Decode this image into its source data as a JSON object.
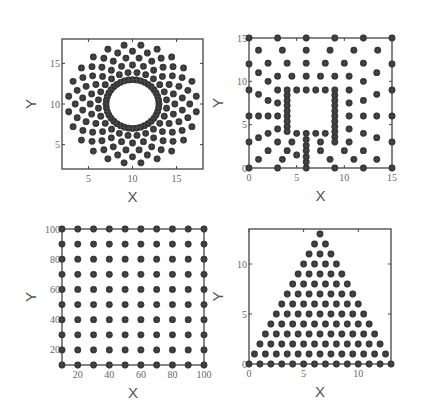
{
  "figure": {
    "background": "#ffffff",
    "marker_color": "#333333",
    "axis_color": "#444444"
  },
  "chart_data": [
    {
      "type": "scatter",
      "id": "ring",
      "title": "",
      "xlabel": "X",
      "ylabel": "Y",
      "xlim": [
        2,
        18
      ],
      "ylim": [
        2,
        18
      ],
      "xticks": [
        5,
        10,
        15
      ],
      "yticks": [
        5,
        10,
        15
      ],
      "grid": false,
      "description": "Annular point set: dense inner ring radius ~3 centered at (10,10), plus staggered concentric rings out to radius ~7.3",
      "generator": {
        "kind": "rings",
        "center": [
          10,
          10
        ],
        "radii": [
          3.0,
          3.9,
          4.8,
          5.7,
          6.5,
          7.3
        ],
        "counts": [
          40,
          24,
          24,
          24,
          24,
          24
        ]
      },
      "frame": {
        "left": 62,
        "top": 39,
        "width": 141,
        "height": 130
      }
    },
    {
      "type": "scatter",
      "id": "square-with-hole",
      "title": "",
      "xlabel": "X",
      "ylabel": "Y",
      "xlim": [
        0,
        15
      ],
      "ylim": [
        0,
        15
      ],
      "xticks": [
        0,
        5,
        10,
        15
      ],
      "yticks": [
        0,
        5,
        10,
        15
      ],
      "grid": false,
      "description": "Square domain [0,15]x[0,15] with inner square hole [4,9]x[4,9]; dense points on hole boundary, sparser points outward",
      "points": [
        [
          0,
          0
        ],
        [
          3,
          0
        ],
        [
          6,
          0
        ],
        [
          9,
          0
        ],
        [
          12,
          0
        ],
        [
          15,
          0
        ],
        [
          0,
          15
        ],
        [
          3,
          15
        ],
        [
          6,
          15
        ],
        [
          9,
          15
        ],
        [
          12,
          15
        ],
        [
          15,
          15
        ],
        [
          0,
          3
        ],
        [
          0,
          6
        ],
        [
          0,
          9
        ],
        [
          0,
          12
        ],
        [
          15,
          3
        ],
        [
          15,
          6
        ],
        [
          15,
          9
        ],
        [
          15,
          12
        ],
        [
          1,
          13.6
        ],
        [
          3.5,
          13.6
        ],
        [
          6,
          13.6
        ],
        [
          8.5,
          13.6
        ],
        [
          11,
          13.6
        ],
        [
          13.5,
          13.6
        ],
        [
          2,
          12.1
        ],
        [
          4,
          12.1
        ],
        [
          6,
          12.1
        ],
        [
          8,
          12.1
        ],
        [
          10,
          12.1
        ],
        [
          12,
          12.1
        ],
        [
          1,
          11
        ],
        [
          13.4,
          11
        ],
        [
          2,
          10
        ],
        [
          12,
          10
        ],
        [
          3,
          10.6
        ],
        [
          4.5,
          10.6
        ],
        [
          6,
          10.6
        ],
        [
          7.5,
          10.6
        ],
        [
          9,
          10.6
        ],
        [
          10.5,
          10.6
        ],
        [
          1,
          8.5
        ],
        [
          13.4,
          8.5
        ],
        [
          2,
          7.8
        ],
        [
          12,
          7.8
        ],
        [
          3,
          9
        ],
        [
          3,
          7.5
        ],
        [
          3,
          6
        ],
        [
          3,
          4.5
        ],
        [
          3,
          3
        ],
        [
          1,
          6
        ],
        [
          2,
          6
        ],
        [
          10.5,
          6
        ],
        [
          12,
          6
        ],
        [
          13.4,
          6
        ],
        [
          1,
          3.5
        ],
        [
          13.4,
          3.5
        ],
        [
          2,
          4
        ],
        [
          12,
          4
        ],
        [
          2,
          2
        ],
        [
          12,
          2
        ],
        [
          1,
          1
        ],
        [
          13.4,
          1
        ],
        [
          11,
          1
        ],
        [
          3.5,
          1
        ],
        [
          4,
          2
        ],
        [
          8.5,
          1
        ],
        [
          7.5,
          2
        ],
        [
          5,
          1.5
        ],
        [
          10.5,
          9
        ],
        [
          10.5,
          7.5
        ],
        [
          10.5,
          4.5
        ],
        [
          10.5,
          3
        ],
        [
          10,
          2
        ],
        [
          4,
          9
        ],
        [
          4,
          8.4
        ],
        [
          4,
          7.8
        ],
        [
          4,
          7.2
        ],
        [
          4,
          6.6
        ],
        [
          4,
          6
        ],
        [
          4,
          5.4
        ],
        [
          4,
          4.8
        ],
        [
          4,
          4.2
        ],
        [
          9,
          9
        ],
        [
          9,
          8.4
        ],
        [
          9,
          7.8
        ],
        [
          9,
          7.2
        ],
        [
          9,
          6.6
        ],
        [
          9,
          6
        ],
        [
          9,
          5.4
        ],
        [
          9,
          4.8
        ],
        [
          9,
          4.2
        ],
        [
          9,
          3.6
        ],
        [
          9,
          3
        ],
        [
          5,
          9
        ],
        [
          6,
          9
        ],
        [
          7,
          9
        ],
        [
          8,
          9
        ],
        [
          5,
          4
        ],
        [
          7,
          4
        ],
        [
          8,
          4
        ],
        [
          6,
          4
        ],
        [
          6,
          3.3
        ],
        [
          6,
          2.6
        ],
        [
          6,
          2
        ],
        [
          6,
          1.3
        ],
        [
          6,
          0.7
        ],
        [
          4.5,
          3
        ],
        [
          7.5,
          3
        ]
      ],
      "frame": {
        "left": 249,
        "top": 38,
        "width": 143,
        "height": 130
      }
    },
    {
      "type": "scatter",
      "id": "uniform-grid",
      "title": "",
      "xlabel": "X",
      "ylabel": "Y",
      "xlim": [
        10,
        100
      ],
      "ylim": [
        10,
        100
      ],
      "xticks": [
        20,
        40,
        60,
        80,
        100
      ],
      "yticks": [
        20,
        40,
        60,
        80,
        100
      ],
      "grid": false,
      "description": "Regular 10x10 grid of points at x,y in {10,20,...,100}",
      "generator": {
        "kind": "grid",
        "x": [
          10,
          20,
          30,
          40,
          50,
          60,
          70,
          80,
          90,
          100
        ],
        "y": [
          10,
          20,
          30,
          40,
          50,
          60,
          70,
          80,
          90,
          100
        ]
      },
      "frame": {
        "left": 62,
        "top": 229,
        "width": 142,
        "height": 136
      }
    },
    {
      "type": "scatter",
      "id": "triangle",
      "title": "",
      "xlabel": "X",
      "ylabel": "Y",
      "xlim": [
        0,
        13
      ],
      "ylim": [
        0,
        13.5
      ],
      "xticks": [
        0,
        5,
        10
      ],
      "yticks": [
        0,
        5,
        10
      ],
      "grid": false,
      "description": "Triangular lattice filling triangle with base [0,13] at y=0 and apex (6.5,13); row k at y=k has 14-k points",
      "generator": {
        "kind": "triangle",
        "base": [
          0,
          13
        ],
        "apex": [
          6.5,
          13
        ],
        "rows": 14
      },
      "frame": {
        "left": 249,
        "top": 229,
        "width": 142,
        "height": 135
      }
    }
  ]
}
